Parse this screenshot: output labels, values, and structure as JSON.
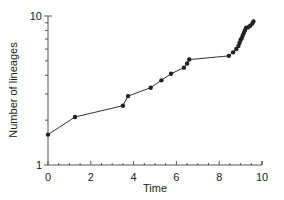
{
  "chart_data": {
    "type": "line",
    "title": "",
    "xlabel": "Time",
    "ylabel": "Number of lineages",
    "xlim": [
      0,
      10
    ],
    "ylim": [
      1,
      10
    ],
    "yscale": "log",
    "grid": false,
    "legend": null,
    "x_ticks": [
      "0",
      "2",
      "4",
      "6",
      "8",
      "10"
    ],
    "y_ticks": [
      "1",
      "10"
    ],
    "series": [
      {
        "name": "lineages",
        "marker": "circle",
        "x": [
          0,
          1.26,
          3.5,
          3.74,
          4.8,
          5.3,
          5.75,
          6.35,
          6.5,
          6.6,
          8.45,
          8.65,
          8.8,
          8.9,
          8.95,
          9.0,
          9.05,
          9.1,
          9.15,
          9.2,
          9.25,
          9.35,
          9.45,
          9.55,
          9.6
        ],
        "y": [
          1.6,
          2.1,
          2.5,
          2.9,
          3.3,
          3.7,
          4.1,
          4.5,
          4.8,
          5.1,
          5.4,
          5.7,
          6.0,
          6.3,
          6.6,
          6.9,
          7.1,
          7.4,
          7.7,
          8.0,
          8.3,
          8.4,
          8.6,
          8.9,
          9.2
        ]
      }
    ]
  }
}
